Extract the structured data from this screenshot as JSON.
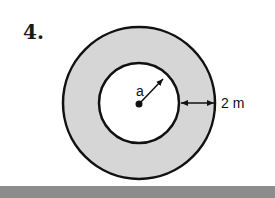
{
  "problem": {
    "number_label": "4."
  },
  "diagram": {
    "inner_radius_label": "a",
    "width_label": "2 m",
    "colors": {
      "ring_fill": "#d6d6d6",
      "inner_fill": "#ffffff",
      "stroke": "#111111",
      "bottom_bar": "#8c8c8c"
    }
  }
}
